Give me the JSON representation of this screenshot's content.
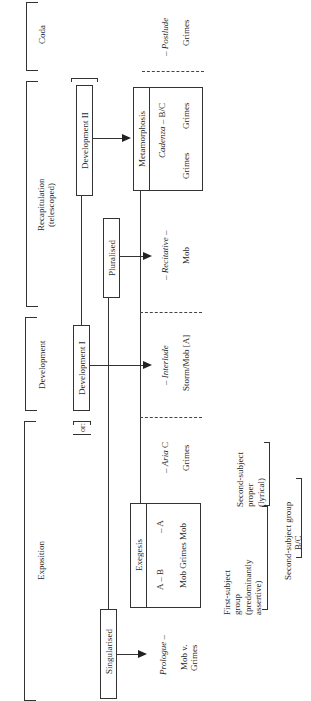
{
  "sections": {
    "coda": "Coda",
    "recap_line1": "Recapitulation",
    "recap_line2": "(telescoped)",
    "development": "Development",
    "exposition": "Exposition"
  },
  "boxes": {
    "development_ii": "Development II",
    "pluralised": "Pluralised",
    "development_i": "Development I",
    "or_label": "or:",
    "singularised": "Singularised"
  },
  "metamorphosis": {
    "title": "Metamorphosis",
    "cadenza_it": "Cadenza",
    "cadenza_rest": " – B/C",
    "grimes1": "Grimes",
    "grimes2": "Grimes"
  },
  "exegesis": {
    "title": "Exegesis",
    "row1_a": "A – B",
    "row1_b": "– A",
    "row2": "Mob Grimes Mob"
  },
  "scenes": {
    "postlude_prefix": "– ",
    "postlude": "Postlude",
    "postlude_char": "Grimes",
    "recitative": "– Recitative –",
    "recitative_char": "Mob",
    "interlude_prefix": "– ",
    "interlude": "Interlude",
    "interlude_char": "Storm/Mob [A]",
    "aria_prefix": "– ",
    "aria": "Aria",
    "aria_suffix": " C",
    "aria_char": "Grimes",
    "prologue": "Prologue",
    "prologue_suffix": " –",
    "prologue_char1": "Mob v.",
    "prologue_char2": "Grimes"
  },
  "groups": {
    "first_subject_l1": "First-subject",
    "first_subject_l2": "group",
    "first_subject_l3": "(predominantly",
    "first_subject_l4": "assertive)",
    "second_proper_l1": "Second-subject",
    "second_proper_l2": "proper",
    "second_proper_l3": "(lyrical)",
    "second_group_l1": "Second-subject group",
    "second_group_l2": "B/C"
  }
}
